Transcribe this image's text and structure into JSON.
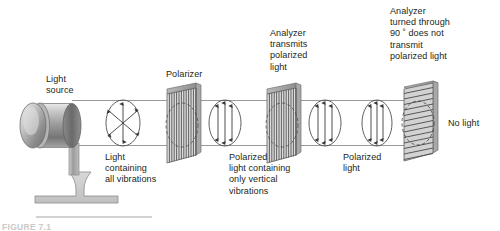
{
  "figure": {
    "caption": "FIGURE 7.1",
    "background_color": "#ffffff",
    "ink_color": "#231f20",
    "beam_line_color": "#9a9a9a",
    "panel_fill": "#d9d9d9",
    "panel_line_color": "#58595b",
    "lamp_color": "#9d9d9d"
  },
  "labels": {
    "light_source": "Light\nsource",
    "polarizer": "Polarizer",
    "analyzer_transmits": "Analyzer\ntransmits\npolarized\nlight",
    "analyzer_turned": "Analyzer\nturned through\n90 ˚ does not\ntransmit\npolarized light",
    "light_all_vibrations": "Light\ncontaining\nall vibrations",
    "polarized_vertical": "Polarized\nlight containing\nonly vertical\nvibrations",
    "polarized_light": "Polarized\nlight",
    "no_light": "No light"
  },
  "elements": {
    "lamp": {
      "name": "light-source-lamp",
      "shape": "cylinder-on-stand"
    },
    "beam": {
      "name": "light-beam",
      "top_y": 100,
      "bottom_y": 145
    },
    "wave_unpolarized": {
      "name": "unpolarized-vibration-ellipse",
      "arrow_count": 6,
      "orientation": "all-directions"
    },
    "wave_polarized_1": {
      "name": "polarized-vibration-ellipse-1",
      "arrow_count": 3,
      "orientation": "vertical"
    },
    "wave_polarized_2": {
      "name": "polarized-vibration-ellipse-2",
      "arrow_count": 3,
      "orientation": "vertical"
    },
    "wave_polarized_3": {
      "name": "polarized-vibration-ellipse-3",
      "arrow_count": 3,
      "orientation": "vertical"
    },
    "panel_polarizer": {
      "name": "polarizer-panel",
      "grating": "vertical"
    },
    "panel_analyzer": {
      "name": "analyzer-panel",
      "grating": "vertical"
    },
    "panel_analyzer_rotated": {
      "name": "analyzer-rotated-panel",
      "grating": "horizontal",
      "rotation_degrees": 90
    }
  }
}
